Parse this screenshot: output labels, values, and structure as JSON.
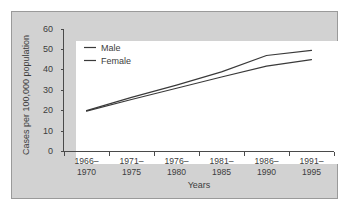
{
  "chart_data": {
    "type": "line",
    "title": "",
    "xlabel": "Years",
    "ylabel": "Cases per 100,000 population",
    "categories": [
      "1966–1970",
      "1971–1975",
      "1976–1980",
      "1981–1985",
      "1986–1990",
      "1991–1995"
    ],
    "category_lines": [
      [
        "1966–",
        "1970"
      ],
      [
        "1971–",
        "1975"
      ],
      [
        "1976–",
        "1980"
      ],
      [
        "1981–",
        "1985"
      ],
      [
        "1986–",
        "1990"
      ],
      [
        "1991–",
        "1995"
      ]
    ],
    "ylim": [
      0,
      60
    ],
    "yticks": [
      0,
      10,
      20,
      30,
      40,
      50,
      60
    ],
    "ytick_labels": [
      "0",
      "10",
      "20",
      "30",
      "40",
      "50",
      "60"
    ],
    "grid": false,
    "legend_position": "upper-left-inside",
    "series": [
      {
        "name": "Male",
        "color": "#3a3a3a",
        "values": [
          20.0,
          26.5,
          32.5,
          39.0,
          47.0,
          49.5
        ]
      },
      {
        "name": "Female",
        "color": "#3a3a3a",
        "values": [
          19.8,
          25.5,
          31.0,
          36.5,
          41.8,
          45.0
        ]
      }
    ]
  },
  "legend": {
    "entries": [
      {
        "label": "Male"
      },
      {
        "label": "Female"
      }
    ]
  },
  "colors": {
    "panel_background": "#d2d2d2",
    "panel_border": "#9a9a9a",
    "plot_background": "#ffffff",
    "axis": "#4a4a4a",
    "text": "#3d3d3d",
    "line": "#3a3a3a"
  }
}
